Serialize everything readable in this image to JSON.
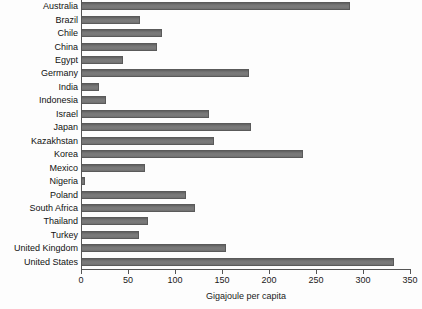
{
  "chart_data": {
    "type": "bar",
    "orientation": "horizontal",
    "title": "",
    "xlabel": "Gigajoule per capita",
    "ylabel": "",
    "xlim": [
      0,
      350
    ],
    "xticks": [
      0,
      50,
      100,
      150,
      200,
      250,
      300,
      350
    ],
    "grid": false,
    "legend": null,
    "bar_color": "#6f6f6f",
    "categories": [
      "Australia",
      "Brazil",
      "Chile",
      "China",
      "Egypt",
      "Germany",
      "India",
      "Indonesia",
      "Israel",
      "Japan",
      "Kazakhstan",
      "Korea",
      "Mexico",
      "Nigeria",
      "Poland",
      "South Africa",
      "Thailand",
      "Turkey",
      "United Kingdom",
      "United States"
    ],
    "values": [
      285,
      62,
      85,
      80,
      44,
      178,
      18,
      26,
      135,
      180,
      140,
      235,
      67,
      3,
      111,
      120,
      70,
      61,
      153,
      332
    ]
  }
}
